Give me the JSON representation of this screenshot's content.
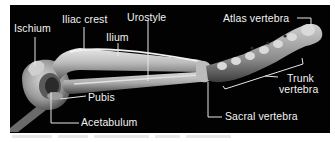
{
  "figure": {
    "background_color": "#020202",
    "label_color": "#f2f2f2",
    "labels": [
      {
        "id": "ischium",
        "text": "Ischium"
      },
      {
        "id": "iliac-crest",
        "text": "Iliac crest"
      },
      {
        "id": "ilium",
        "text": "Ilium"
      },
      {
        "id": "urostyle",
        "text": "Urostyle"
      },
      {
        "id": "atlas-vertebra",
        "text": "Atlas vertebra"
      },
      {
        "id": "pubis",
        "text": "Pubis"
      },
      {
        "id": "acetabulum",
        "text": "Acetabulum"
      },
      {
        "id": "trunk-vertebra-line1",
        "text": "Trunk"
      },
      {
        "id": "trunk-vertebra-line2",
        "text": "vertebra"
      },
      {
        "id": "sacral-vertebra",
        "text": "Sacral vertebra"
      }
    ]
  }
}
